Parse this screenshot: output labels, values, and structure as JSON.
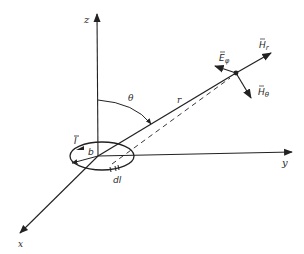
{
  "figure": {
    "axes": {
      "z_label": "z",
      "x_label": "x",
      "y_label": "y"
    },
    "angle_label": "θ",
    "radius_label": "r",
    "loop": {
      "current_label": "I",
      "radius_label": "b",
      "element_label": "dl"
    },
    "field_vectors": {
      "h_r": {
        "base": "H",
        "sub": "r"
      },
      "e_phi": {
        "base": "E",
        "sub": "φ"
      },
      "h_theta": {
        "base": "H",
        "sub": "θ"
      }
    },
    "colors": {
      "ink": "#222222",
      "background": "#ffffff"
    }
  }
}
